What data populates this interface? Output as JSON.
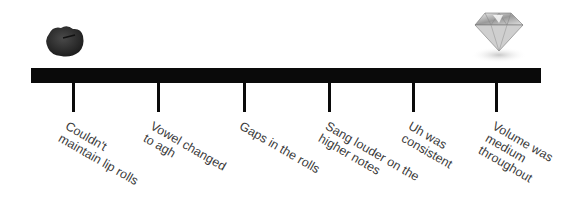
{
  "diagram": {
    "type": "timeline-scale",
    "left_end": {
      "icon": "rock-icon",
      "meaning": "rough"
    },
    "right_end": {
      "icon": "diamond-icon",
      "meaning": "polished"
    },
    "colors": {
      "bar": "#0a0a0a",
      "text": "#3a3a3a",
      "background": "#ffffff"
    },
    "items": [
      {
        "label": "Couldn't\nmaintain lip rolls"
      },
      {
        "label": "Vowel changed\nto agh"
      },
      {
        "label": "Gaps in the rolls"
      },
      {
        "label": "Sang louder on the\nhigher notes"
      },
      {
        "label": "Uh was\nconsistent"
      },
      {
        "label": "Volume was\nmedium\nthroughout"
      }
    ]
  }
}
